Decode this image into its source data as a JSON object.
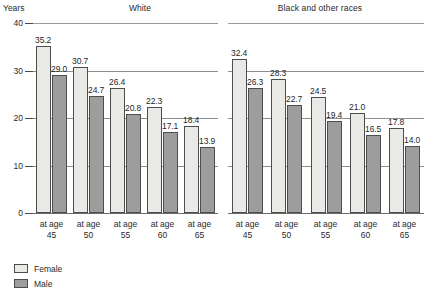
{
  "chart_data": {
    "type": "bar",
    "title": "",
    "subtitle": "",
    "xlabel": "",
    "ylabel": "Years",
    "ylim": [
      0,
      40
    ],
    "yticks": [
      "0",
      "10",
      "20",
      "30",
      "40"
    ],
    "grid": true,
    "legend_position": "bottom-left",
    "categories": [
      "at age 45",
      "at age 50",
      "at age 55",
      "at age 60",
      "at age 65"
    ],
    "category_lines": [
      {
        "line1": "at age",
        "line2": "45"
      },
      {
        "line1": "at age",
        "line2": "50"
      },
      {
        "line1": "at age",
        "line2": "55"
      },
      {
        "line1": "at age",
        "line2": "60"
      },
      {
        "line1": "at age",
        "line2": "65"
      }
    ],
    "panels": [
      {
        "name": "White",
        "series": [
          {
            "name": "Female",
            "values": [
              35.2,
              30.7,
              26.4,
              22.3,
              18.4
            ]
          },
          {
            "name": "Male",
            "values": [
              29.0,
              24.7,
              20.8,
              17.1,
              13.9
            ]
          }
        ]
      },
      {
        "name": "Black and other races",
        "series": [
          {
            "name": "Female",
            "values": [
              32.4,
              28.3,
              24.5,
              21.0,
              17.8
            ]
          },
          {
            "name": "Male",
            "values": [
              26.3,
              22.7,
              19.4,
              16.5,
              14.0
            ]
          }
        ]
      }
    ],
    "legend": [
      {
        "label": "Female",
        "color": "#e9e9e6"
      },
      {
        "label": "Male",
        "color": "#9d9d9d"
      }
    ],
    "colors": {
      "female": "#e9e9e6",
      "male": "#9d9d9d",
      "bar_outline": "#4d4d4d",
      "gridline": "#8e8e8e",
      "axis": "#4a4a4a",
      "text": "#2a2a2a",
      "background": "#ffffff"
    }
  }
}
